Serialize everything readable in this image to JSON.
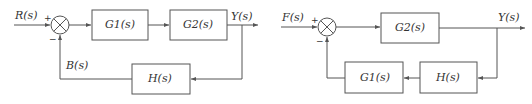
{
  "diagrams": [
    {
      "id": "left",
      "input_label": "R(s)",
      "output_label": "Y(s)",
      "feedback_label": "B(s)",
      "plus_sign": "+",
      "minus_sign": "−",
      "blocks": {
        "forward_1": "G1(s)",
        "forward_2": "G2(s)",
        "feedback": "H(s)"
      }
    },
    {
      "id": "right",
      "input_label": "F(s)",
      "output_label": "Y(s)",
      "plus_sign": "+",
      "minus_sign": "−",
      "blocks": {
        "forward": "G2(s)",
        "feedback_1": "H(s)",
        "feedback_2": "G1(s)"
      }
    }
  ],
  "colors": {
    "line": "#555555",
    "text": "#333333",
    "background": "#ffffff"
  }
}
